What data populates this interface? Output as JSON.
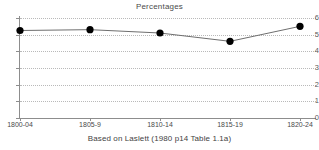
{
  "chart_data": {
    "type": "line",
    "title": "Percentages",
    "xlabel": "Based on Laslett (1980 p14 Table 1.1a)",
    "ylabel": "",
    "categories": [
      "1800-04",
      "1805-9",
      "1810-14",
      "1815-19",
      "1820-24"
    ],
    "values": [
      5.25,
      5.3,
      5.1,
      4.6,
      5.5
    ],
    "series": [
      {
        "name": "Percentages",
        "values": [
          5.25,
          5.3,
          5.1,
          4.6,
          5.5
        ]
      }
    ],
    "ylim": [
      0,
      6
    ],
    "y_ticks": [
      "0",
      "1",
      "2",
      "3",
      "4",
      "5",
      "6"
    ],
    "grid": true,
    "legend": "none",
    "marker": "filled-circle",
    "marker_color": "#000000",
    "line_color": "#6e6e6e",
    "grid_color": "#b9b9b9",
    "axis_color": "#8d8d8d",
    "background_color": "#ffffff"
  },
  "figure": {
    "title": "Percentages",
    "caption": "Based on Laslett (1980 p14 Table 1.1a)"
  }
}
